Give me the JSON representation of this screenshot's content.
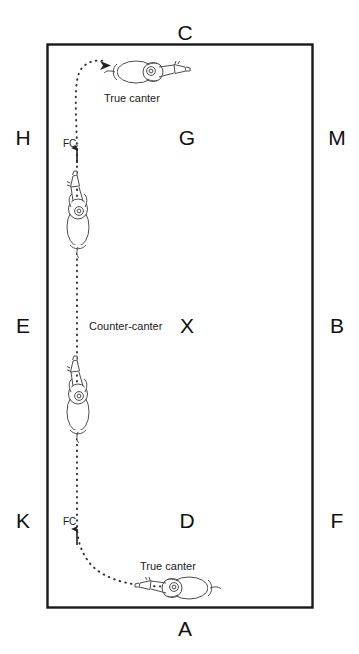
{
  "diagram": {
    "title_visible": false,
    "type": "dressage-arena-figure",
    "colors": {
      "arena_border": "#1a1a1a",
      "path": "#333333",
      "text": "#111111",
      "background": "#ffffff",
      "horse_outline": "#555555"
    },
    "arena": {
      "left": 47,
      "top": 44,
      "right": 313,
      "bottom": 608
    },
    "markers": [
      {
        "name": "marker-c",
        "label": "C",
        "x": 185,
        "y": 22,
        "side": "top"
      },
      {
        "name": "marker-a",
        "label": "A",
        "x": 185,
        "y": 618,
        "side": "bottom"
      },
      {
        "name": "marker-h",
        "label": "H",
        "x": 16,
        "y": 127,
        "side": "left"
      },
      {
        "name": "marker-e",
        "label": "E",
        "x": 16,
        "y": 315,
        "side": "left"
      },
      {
        "name": "marker-k",
        "label": "K",
        "x": 16,
        "y": 510,
        "side": "left"
      },
      {
        "name": "marker-m",
        "label": "M",
        "x": 320,
        "y": 127,
        "side": "right"
      },
      {
        "name": "marker-b",
        "label": "B",
        "x": 320,
        "y": 315,
        "side": "right"
      },
      {
        "name": "marker-f",
        "label": "F",
        "x": 320,
        "y": 510,
        "side": "right"
      },
      {
        "name": "marker-g",
        "label": "G",
        "x": 172,
        "y": 127,
        "side": "inner"
      },
      {
        "name": "marker-x",
        "label": "X",
        "x": 172,
        "y": 315,
        "side": "inner"
      },
      {
        "name": "marker-d",
        "label": "D",
        "x": 172,
        "y": 510,
        "side": "inner"
      }
    ],
    "annotations": [
      {
        "name": "gait-label-true-canter-top",
        "label": "True canter",
        "x": 104,
        "y": 93
      },
      {
        "name": "gait-label-counter-canter",
        "label": "Counter-canter",
        "x": 89,
        "y": 321
      },
      {
        "name": "gait-label-true-canter-bottom",
        "label": "True canter",
        "x": 140,
        "y": 561
      },
      {
        "name": "flying-change-label-upper",
        "label": "FC",
        "x": 63,
        "y": 139
      },
      {
        "name": "flying-change-label-lower",
        "label": "FC",
        "x": 63,
        "y": 517
      }
    ],
    "path": {
      "style": "dotted",
      "description": "continuous dotted track from bottom right curving left, up the long side and curving right at the top"
    },
    "horses": [
      {
        "name": "horse-figure-top",
        "orientation": "facing-right",
        "x": 145,
        "y": 72
      },
      {
        "name": "horse-figure-upper-left",
        "orientation": "facing-up",
        "x": 78,
        "y": 215
      },
      {
        "name": "horse-figure-lower-left",
        "orientation": "facing-up",
        "x": 78,
        "y": 400
      },
      {
        "name": "horse-figure-bottom",
        "orientation": "facing-left",
        "x": 180,
        "y": 588
      }
    ]
  }
}
